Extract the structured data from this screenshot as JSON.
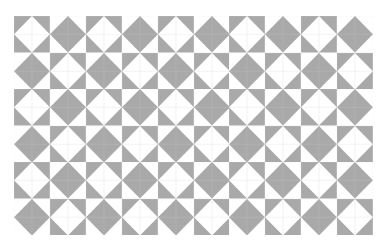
{
  "pattern": {
    "name": "diamond-tile-grid",
    "columns": 10,
    "rows": 6,
    "colors": {
      "grey": "#a9a9a9",
      "white": "#ffffff",
      "line_on_white": "#e2e2e2",
      "line_on_grey": "#bcbcbc"
    },
    "tile_types": {
      "A": "grey corners, white diamond",
      "B": "white corners, grey diamond"
    },
    "layout": [
      [
        "A",
        "B",
        "A",
        "B",
        "A",
        "B",
        "A",
        "B",
        "A",
        "B"
      ],
      [
        "B",
        "A",
        "B",
        "A",
        "B",
        "A",
        "B",
        "A",
        "B",
        "A"
      ],
      [
        "A",
        "B",
        "A",
        "B",
        "A",
        "B",
        "A",
        "B",
        "A",
        "B"
      ],
      [
        "B",
        "A",
        "B",
        "A",
        "B",
        "A",
        "B",
        "A",
        "B",
        "A"
      ],
      [
        "A",
        "B",
        "A",
        "B",
        "A",
        "B",
        "A",
        "B",
        "A",
        "B"
      ],
      [
        "B",
        "A",
        "B",
        "A",
        "B",
        "A",
        "B",
        "A",
        "B",
        "A"
      ]
    ]
  }
}
